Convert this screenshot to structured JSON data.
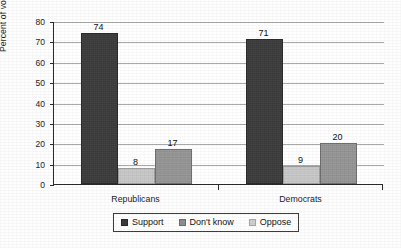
{
  "chart_data": {
    "type": "bar",
    "title": "",
    "subtitle": "",
    "xlabel": "",
    "ylabel": "Percent of voters",
    "ylim": [
      0,
      80
    ],
    "ytick_step": 10,
    "yticks": [
      "80",
      "70",
      "60",
      "50",
      "40",
      "30",
      "20",
      "10",
      "0"
    ],
    "grid": true,
    "grid_axis": "y",
    "legend_position": "bottom",
    "categories": [
      "Republicans",
      "Democrats"
    ],
    "series": [
      {
        "name": "Support",
        "values": [
          74,
          71
        ],
        "color": "#3b3b3b"
      },
      {
        "name": "Don't know",
        "values": [
          8,
          9
        ],
        "color": "#c9c9c9"
      },
      {
        "name": "Oppose",
        "values": [
          17,
          20
        ],
        "color": "#969696"
      }
    ],
    "data_labels": [
      "74",
      "8",
      "17",
      "71",
      "9",
      "20"
    ]
  },
  "axis": {
    "y_title": "Percent of voters",
    "ticks": [
      {
        "label": "80",
        "value": 80
      },
      {
        "label": "70",
        "value": 70
      },
      {
        "label": "60",
        "value": 60
      },
      {
        "label": "50",
        "value": 50
      },
      {
        "label": "40",
        "value": 40
      },
      {
        "label": "30",
        "value": 30
      },
      {
        "label": "20",
        "value": 20
      },
      {
        "label": "10",
        "value": 10
      },
      {
        "label": "0",
        "value": 0
      }
    ]
  },
  "categories": [
    {
      "label": "Republicans"
    },
    {
      "label": "Democrats"
    }
  ],
  "bars": [
    {
      "label": "74",
      "value": 74,
      "series": "Support",
      "group": "Republicans",
      "style": "s-support"
    },
    {
      "label": "8",
      "value": 8,
      "series": "Don't know",
      "group": "Republicans",
      "style": "s-dontknow"
    },
    {
      "label": "17",
      "value": 17,
      "series": "Oppose",
      "group": "Republicans",
      "style": "s-oppose"
    },
    {
      "label": "71",
      "value": 71,
      "series": "Support",
      "group": "Democrats",
      "style": "s-support"
    },
    {
      "label": "9",
      "value": 9,
      "series": "Don't know",
      "group": "Democrats",
      "style": "s-dontknow"
    },
    {
      "label": "20",
      "value": 20,
      "series": "Oppose",
      "group": "Democrats",
      "style": "s-oppose"
    }
  ],
  "legend": {
    "items": [
      {
        "label": "Support",
        "style": "s-support"
      },
      {
        "label": "Don't know",
        "style": "s-dontknow"
      },
      {
        "label": "Oppose",
        "style": "s-oppose"
      }
    ]
  }
}
